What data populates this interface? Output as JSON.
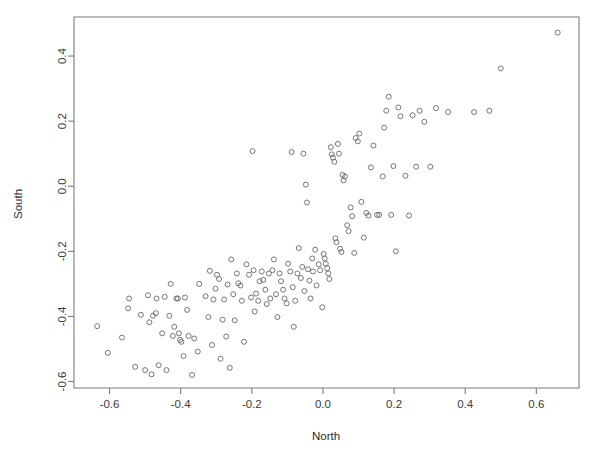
{
  "chart_data": {
    "type": "scatter",
    "title": "",
    "xlabel": "North",
    "ylabel": "South",
    "xlim": [
      -0.7,
      0.72
    ],
    "ylim": [
      -0.62,
      0.52
    ],
    "grid": false,
    "legend": null,
    "marker": "open-circle",
    "marker_color": "#6e6e76",
    "marker_size": 5,
    "xticks": [
      -0.6,
      -0.4,
      -0.2,
      0.0,
      0.2,
      0.4,
      0.6
    ],
    "xtick_labels": [
      "-0.6",
      "-0.4",
      "-0.2",
      "0.0",
      "0.2",
      "0.4",
      "0.6"
    ],
    "yticks": [
      -0.6,
      -0.4,
      -0.2,
      0.0,
      0.2,
      0.4
    ],
    "ytick_labels": [
      "-0.6",
      "-0.4",
      "-0.2",
      "0.0",
      "0.2",
      "0.4"
    ],
    "n_points": 163,
    "points": [
      [
        -0.635,
        -0.43
      ],
      [
        -0.605,
        -0.512
      ],
      [
        -0.565,
        -0.465
      ],
      [
        -0.548,
        -0.375
      ],
      [
        -0.545,
        -0.345
      ],
      [
        -0.528,
        -0.555
      ],
      [
        -0.512,
        -0.395
      ],
      [
        -0.5,
        -0.565
      ],
      [
        -0.492,
        -0.335
      ],
      [
        -0.488,
        -0.418
      ],
      [
        -0.482,
        -0.578
      ],
      [
        -0.478,
        -0.398
      ],
      [
        -0.47,
        -0.39
      ],
      [
        -0.468,
        -0.345
      ],
      [
        -0.462,
        -0.55
      ],
      [
        -0.452,
        -0.452
      ],
      [
        -0.445,
        -0.34
      ],
      [
        -0.44,
        -0.565
      ],
      [
        -0.432,
        -0.398
      ],
      [
        -0.428,
        -0.3
      ],
      [
        -0.422,
        -0.46
      ],
      [
        -0.418,
        -0.432
      ],
      [
        -0.412,
        -0.345
      ],
      [
        -0.408,
        -0.345
      ],
      [
        -0.405,
        -0.452
      ],
      [
        -0.402,
        -0.472
      ],
      [
        -0.398,
        -0.478
      ],
      [
        -0.392,
        -0.522
      ],
      [
        -0.388,
        -0.342
      ],
      [
        -0.382,
        -0.38
      ],
      [
        -0.378,
        -0.46
      ],
      [
        -0.368,
        -0.58
      ],
      [
        -0.362,
        -0.468
      ],
      [
        -0.352,
        -0.508
      ],
      [
        -0.348,
        -0.3
      ],
      [
        -0.33,
        -0.338
      ],
      [
        -0.322,
        -0.402
      ],
      [
        -0.318,
        -0.26
      ],
      [
        -0.312,
        -0.488
      ],
      [
        -0.308,
        -0.348
      ],
      [
        -0.302,
        -0.315
      ],
      [
        -0.298,
        -0.272
      ],
      [
        -0.292,
        -0.285
      ],
      [
        -0.288,
        -0.53
      ],
      [
        -0.282,
        -0.41
      ],
      [
        -0.278,
        -0.348
      ],
      [
        -0.272,
        -0.462
      ],
      [
        -0.268,
        -0.302
      ],
      [
        -0.262,
        -0.558
      ],
      [
        -0.258,
        -0.225
      ],
      [
        -0.252,
        -0.332
      ],
      [
        -0.248,
        -0.412
      ],
      [
        -0.242,
        -0.268
      ],
      [
        -0.238,
        -0.298
      ],
      [
        -0.232,
        -0.305
      ],
      [
        -0.228,
        -0.352
      ],
      [
        -0.222,
        -0.478
      ],
      [
        -0.215,
        -0.24
      ],
      [
        -0.208,
        -0.272
      ],
      [
        -0.202,
        -0.342
      ],
      [
        -0.198,
        0.108
      ],
      [
        -0.195,
        -0.258
      ],
      [
        -0.192,
        -0.385
      ],
      [
        -0.188,
        -0.33
      ],
      [
        -0.182,
        -0.352
      ],
      [
        -0.178,
        -0.292
      ],
      [
        -0.172,
        -0.262
      ],
      [
        -0.168,
        -0.288
      ],
      [
        -0.162,
        -0.318
      ],
      [
        -0.158,
        -0.362
      ],
      [
        -0.152,
        -0.268
      ],
      [
        -0.148,
        -0.345
      ],
      [
        -0.142,
        -0.258
      ],
      [
        -0.138,
        -0.225
      ],
      [
        -0.132,
        -0.332
      ],
      [
        -0.128,
        -0.402
      ],
      [
        -0.122,
        -0.268
      ],
      [
        -0.118,
        -0.292
      ],
      [
        -0.112,
        -0.318
      ],
      [
        -0.108,
        -0.345
      ],
      [
        -0.102,
        -0.36
      ],
      [
        -0.098,
        -0.238
      ],
      [
        -0.092,
        -0.262
      ],
      [
        -0.088,
        0.105
      ],
      [
        -0.085,
        -0.31
      ],
      [
        -0.082,
        -0.432
      ],
      [
        -0.078,
        -0.352
      ],
      [
        -0.072,
        -0.268
      ],
      [
        -0.068,
        -0.19
      ],
      [
        -0.062,
        -0.282
      ],
      [
        -0.058,
        -0.248
      ],
      [
        -0.055,
        0.1
      ],
      [
        -0.052,
        -0.322
      ],
      [
        -0.048,
        0.005
      ],
      [
        -0.045,
        -0.05
      ],
      [
        -0.042,
        -0.255
      ],
      [
        -0.038,
        -0.29
      ],
      [
        -0.035,
        -0.345
      ],
      [
        -0.03,
        -0.222
      ],
      [
        -0.028,
        -0.262
      ],
      [
        -0.022,
        -0.195
      ],
      [
        -0.018,
        -0.305
      ],
      [
        -0.012,
        -0.24
      ],
      [
        -0.008,
        -0.258
      ],
      [
        -0.002,
        -0.372
      ],
      [
        0.002,
        -0.208
      ],
      [
        0.005,
        -0.222
      ],
      [
        0.008,
        -0.238
      ],
      [
        0.012,
        -0.252
      ],
      [
        0.015,
        -0.268
      ],
      [
        0.018,
        -0.285
      ],
      [
        0.022,
        0.12
      ],
      [
        0.025,
        0.098
      ],
      [
        0.028,
        0.088
      ],
      [
        0.032,
        0.075
      ],
      [
        0.035,
        -0.16
      ],
      [
        0.038,
        -0.172
      ],
      [
        0.042,
        0.13
      ],
      [
        0.045,
        0.1
      ],
      [
        0.048,
        -0.192
      ],
      [
        0.052,
        -0.202
      ],
      [
        0.055,
        0.035
      ],
      [
        0.058,
        0.018
      ],
      [
        0.062,
        0.03
      ],
      [
        0.068,
        -0.12
      ],
      [
        0.072,
        -0.138
      ],
      [
        0.078,
        -0.065
      ],
      [
        0.082,
        -0.092
      ],
      [
        0.088,
        -0.205
      ],
      [
        0.092,
        0.148
      ],
      [
        0.098,
        0.138
      ],
      [
        0.102,
        0.162
      ],
      [
        0.108,
        -0.048
      ],
      [
        0.115,
        -0.158
      ],
      [
        0.122,
        -0.082
      ],
      [
        0.128,
        -0.09
      ],
      [
        0.135,
        0.058
      ],
      [
        0.142,
        0.125
      ],
      [
        0.152,
        -0.088
      ],
      [
        0.158,
        -0.088
      ],
      [
        0.168,
        0.03
      ],
      [
        0.172,
        0.18
      ],
      [
        0.178,
        0.232
      ],
      [
        0.185,
        0.275
      ],
      [
        0.192,
        -0.088
      ],
      [
        0.198,
        0.062
      ],
      [
        0.205,
        -0.2
      ],
      [
        0.212,
        0.242
      ],
      [
        0.218,
        0.215
      ],
      [
        0.232,
        0.032
      ],
      [
        0.242,
        -0.09
      ],
      [
        0.252,
        0.218
      ],
      [
        0.262,
        0.06
      ],
      [
        0.272,
        0.232
      ],
      [
        0.285,
        0.198
      ],
      [
        0.302,
        0.06
      ],
      [
        0.318,
        0.24
      ],
      [
        0.352,
        0.228
      ],
      [
        0.425,
        0.228
      ],
      [
        0.468,
        0.232
      ],
      [
        0.5,
        0.362
      ],
      [
        0.66,
        0.472
      ]
    ]
  },
  "axis": {
    "x_title": "North",
    "y_title": "South"
  }
}
